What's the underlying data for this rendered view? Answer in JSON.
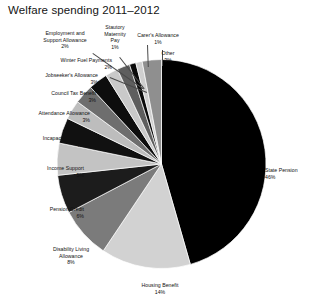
{
  "chart_data": {
    "type": "pie",
    "title": "Welfare spending 2011–2012",
    "xlabel": "",
    "ylabel": "",
    "legend": "none",
    "grid": false,
    "value_unit": "percent",
    "categories": [
      "State Pension",
      "Housing Benefit",
      "Disability Living Allowance",
      "Pension Credit",
      "Income Support",
      "Incapacity Benefit",
      "Attendance Allowance",
      "Council Tax Benefit",
      "Jobseeker's Allowance",
      "Winter Fuel Payments",
      "Employment and Support Allowance",
      "Statutory Maternity Pay",
      "Carer's Allowance",
      "Other"
    ],
    "values": [
      46,
      14,
      8,
      6,
      5,
      4,
      3,
      3,
      3,
      2,
      2,
      1,
      1,
      3
    ],
    "slice_colors": [
      "#000000",
      "#d2d2d2",
      "#7b7b7b",
      "#1c1c1c",
      "#c3c3c3",
      "#111111",
      "#bdbdbd",
      "#6e6e6e",
      "#0d0d0d",
      "#c9c9c9",
      "#5e5e5e",
      "#0a0a0a",
      "#cfcfcf",
      "#8f8f8f"
    ]
  },
  "labels": {
    "state_pension": {
      "name": "State Pension",
      "pct": "46%"
    },
    "housing_benefit": {
      "name": "Housing Benefit",
      "pct": "14%"
    },
    "disability_living": {
      "name": "Disability Living\nAllowance",
      "pct": "8%"
    },
    "pension_credit": {
      "name": "Pension Credit",
      "pct": "6%"
    },
    "income_support": {
      "name": "Income Support",
      "pct": "5%"
    },
    "incapacity_benefit": {
      "name": "Incapacity Benefit",
      "pct": "4%"
    },
    "attendance_allow": {
      "name": "Attendance Allowance",
      "pct": "3%"
    },
    "council_tax": {
      "name": "Council Tax Benefit",
      "pct": "3%"
    },
    "jobseekers": {
      "name": "Jobseeker's Allowance",
      "pct": "3%"
    },
    "winter_fuel": {
      "name": "Winter Fuel Payments",
      "pct": "2%"
    },
    "employment_support": {
      "name": "Employment and\nSupport Allowance",
      "pct": "2%"
    },
    "statutory_maternity": {
      "name": "Stautory\nMaternity\nPay",
      "pct": "1%"
    },
    "carers_allowance": {
      "name": "Carer's Allowance",
      "pct": "1%"
    },
    "other": {
      "name": "Other",
      "pct": "3%"
    }
  }
}
